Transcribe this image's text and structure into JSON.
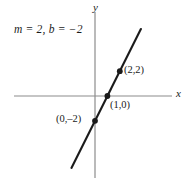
{
  "figure": {
    "background_color": "#ffffff",
    "width": 193,
    "height": 187
  },
  "annotation": {
    "equation_label": "m = 2, b = −2"
  },
  "axes": {
    "x_label": "x",
    "y_label": "y",
    "axis_color": "#8c8c8c",
    "origin_px": {
      "x": 95,
      "y": 96
    },
    "unit_px": 12.4,
    "x_axis_span_px": {
      "from": 14,
      "to": 172
    },
    "y_axis_span_px": {
      "from": 12,
      "to": 178
    }
  },
  "chart_data": {
    "type": "line",
    "title": "",
    "subtitle": "",
    "xlabel": "x",
    "ylabel": "y",
    "xlim": [
      -6.5,
      6.2
    ],
    "ylim": [
      -6.6,
      6.8
    ],
    "grid": false,
    "legend": null,
    "annotations": [
      "m = 2, b = −2"
    ],
    "series": [
      {
        "name": "y = 2x − 2",
        "slope": 2,
        "intercept": -2,
        "color": "#1a1a1a",
        "x": [
          -1.9,
          3.7
        ],
        "y": [
          -5.8,
          5.4
        ]
      }
    ],
    "points": [
      {
        "label": "(1,0)",
        "x": 1,
        "y": 0,
        "label_pos": "below-right"
      },
      {
        "label": "(0,–2)",
        "x": 0,
        "y": -2,
        "label_pos": "left"
      },
      {
        "label": "(2,2)",
        "x": 2,
        "y": 2,
        "label_pos": "right"
      }
    ],
    "point_color": "#1a1a1a",
    "tick_labels": {
      "x": [],
      "y": []
    }
  }
}
